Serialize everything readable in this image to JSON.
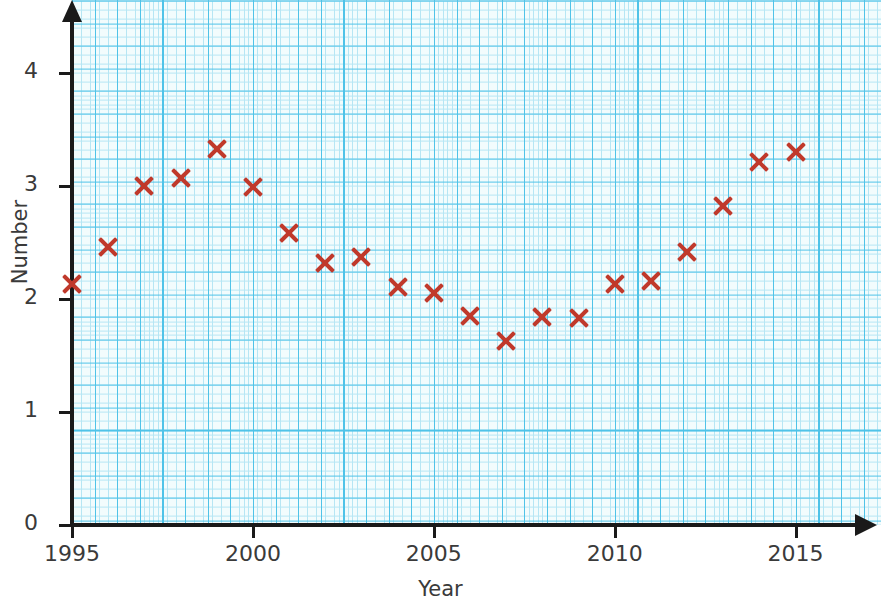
{
  "chart_data": {
    "type": "scatter",
    "title": "",
    "xlabel": "Year",
    "ylabel": "Number",
    "xlim": [
      1994.4,
      2016.2
    ],
    "ylim": [
      0,
      4.5
    ],
    "xticks": [
      1995,
      2000,
      2005,
      2010,
      2015
    ],
    "yticks": [
      0,
      1,
      2,
      3,
      4
    ],
    "grid": true,
    "grid_style": "graph-paper",
    "legend": "none",
    "marker": "x",
    "marker_color": "#c0392b",
    "grid_major_color": "#4fc3e8",
    "grid_minor_color": "#b6e6f4",
    "plot_background": "#f2fcfd",
    "axis_color": "#1a1a1a",
    "label_color": "#3a3a3a",
    "x": [
      1995,
      1996,
      1997,
      1998,
      1999,
      2000,
      2001,
      2002,
      2003,
      2004,
      2005,
      2006,
      2007,
      2008,
      2009,
      2010,
      2011,
      2012,
      2013,
      2014,
      2015
    ],
    "y": [
      2.13,
      2.46,
      3.0,
      3.07,
      3.33,
      2.99,
      2.58,
      2.32,
      2.37,
      2.11,
      2.05,
      1.85,
      1.63,
      1.84,
      1.83,
      2.13,
      2.16,
      2.42,
      2.82,
      3.21,
      3.3
    ],
    "points": [
      {
        "x": 1995,
        "y": 2.13
      },
      {
        "x": 1996,
        "y": 2.46
      },
      {
        "x": 1997,
        "y": 3.0
      },
      {
        "x": 1998,
        "y": 3.07
      },
      {
        "x": 1999,
        "y": 3.33
      },
      {
        "x": 2000,
        "y": 2.99
      },
      {
        "x": 2001,
        "y": 2.58
      },
      {
        "x": 2002,
        "y": 2.32
      },
      {
        "x": 2003,
        "y": 2.37
      },
      {
        "x": 2004,
        "y": 2.11
      },
      {
        "x": 2005,
        "y": 2.05
      },
      {
        "x": 2006,
        "y": 1.85
      },
      {
        "x": 2007,
        "y": 1.63
      },
      {
        "x": 2008,
        "y": 1.84
      },
      {
        "x": 2009,
        "y": 1.83
      },
      {
        "x": 2010,
        "y": 2.13
      },
      {
        "x": 2011,
        "y": 2.16
      },
      {
        "x": 2012,
        "y": 2.42
      },
      {
        "x": 2013,
        "y": 2.82
      },
      {
        "x": 2014,
        "y": 3.21
      },
      {
        "x": 2015,
        "y": 3.3
      }
    ]
  },
  "axes": {
    "x_title": "Year",
    "y_title": "Number",
    "x_tick_labels": [
      "1995",
      "2000",
      "2005",
      "2010",
      "2015"
    ],
    "y_tick_labels": [
      "0",
      "1",
      "2",
      "3",
      "4"
    ]
  }
}
